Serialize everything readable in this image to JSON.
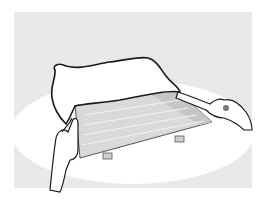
{
  "illustration": {
    "description": "Hands lifting a cloth cover off a rectangular tray/grid on a white surface",
    "colors": {
      "background_panel": "#e9e9e9",
      "surface": "#ffffff",
      "tray": "#d9d9d9",
      "tray_dark": "#c4c4c4",
      "outline": "#1a1a1a",
      "skin": "#ffffff"
    }
  }
}
